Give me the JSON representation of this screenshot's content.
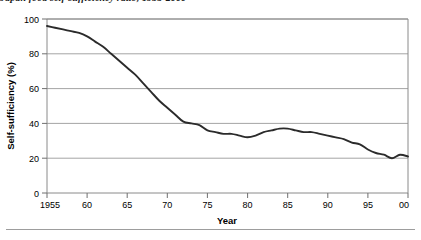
{
  "figure": {
    "caption_clipped": "Japan food self-sufficiency ratio, 1955-2000",
    "footer_rule": "horizontal-rule"
  },
  "chart_data": {
    "type": "line",
    "title": "",
    "xlabel": "Year",
    "ylabel": "Self-sufficiency (%)",
    "xlim": [
      1955,
      2000
    ],
    "ylim": [
      0,
      100
    ],
    "grid": true,
    "legend": "none",
    "x_tick_values": [
      1955,
      1960,
      1965,
      1970,
      1975,
      1980,
      1985,
      1990,
      1995,
      2000
    ],
    "x_tick_labels": [
      "1955",
      "60",
      "65",
      "70",
      "75",
      "80",
      "85",
      "90",
      "95",
      "00"
    ],
    "y_tick_values": [
      0,
      20,
      40,
      60,
      80,
      100
    ],
    "y_tick_labels": [
      "0",
      "20",
      "40",
      "60",
      "80",
      "100"
    ],
    "series": [
      {
        "name": "Self-sufficiency",
        "color": "#2b2b2b",
        "x": [
          1955,
          1956,
          1957,
          1958,
          1959,
          1960,
          1961,
          1962,
          1963,
          1964,
          1965,
          1966,
          1967,
          1968,
          1969,
          1970,
          1971,
          1972,
          1973,
          1974,
          1975,
          1976,
          1977,
          1978,
          1979,
          1980,
          1981,
          1982,
          1983,
          1984,
          1985,
          1986,
          1987,
          1988,
          1989,
          1990,
          1991,
          1992,
          1993,
          1994,
          1995,
          1996,
          1997,
          1998,
          1999,
          2000
        ],
        "values": [
          96,
          95,
          94,
          93,
          92,
          90,
          87,
          84,
          80,
          76,
          72,
          68,
          63,
          58,
          53,
          49,
          45,
          41,
          40,
          39,
          36,
          35,
          34,
          34,
          33,
          32,
          33,
          35,
          36,
          37,
          37,
          36,
          35,
          35,
          34,
          33,
          32,
          31,
          29,
          28,
          25,
          23,
          22,
          20,
          22,
          21
        ]
      }
    ]
  }
}
